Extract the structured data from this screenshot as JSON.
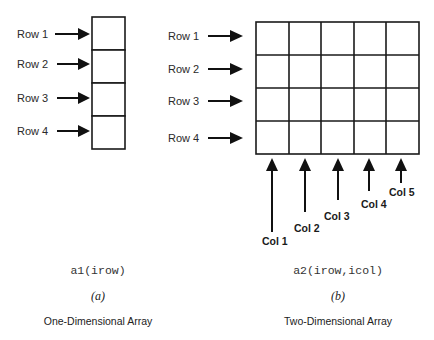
{
  "one_d": {
    "rows": [
      {
        "label": "Row 1"
      },
      {
        "label": "Row 2"
      },
      {
        "label": "Row 3"
      },
      {
        "label": "Row 4"
      }
    ],
    "expression": "a1(irow)",
    "caption": "(a)",
    "title": "One-Dimensional Array"
  },
  "two_d": {
    "rows": [
      {
        "label": "Row 1"
      },
      {
        "label": "Row 2"
      },
      {
        "label": "Row 3"
      },
      {
        "label": "Row 4"
      }
    ],
    "cols": [
      {
        "label": "Col 1"
      },
      {
        "label": "Col 2"
      },
      {
        "label": "Col 3"
      },
      {
        "label": "Col 4"
      },
      {
        "label": "Col 5"
      }
    ],
    "expression": "a2(irow,icol)",
    "caption": "(b)",
    "title": "Two-Dimensional Array"
  },
  "colors": {
    "line": "#1a1a1a",
    "background": "#ffffff"
  }
}
